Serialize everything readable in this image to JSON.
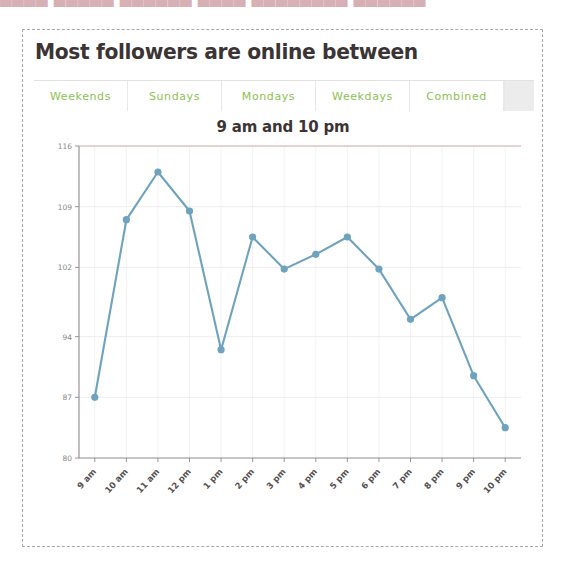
{
  "top_cut_text": "▄▄▄▄ ▄▄▄▄▄ ▄▄▄▄▄▄ ▄▄▄▄ ▄▄▄▄▄▄▄▄ ▄▄▄▄▄▄",
  "widget": {
    "title": "Most followers are online between"
  },
  "tabs": {
    "items": [
      {
        "label": "Weekends",
        "selected": false
      },
      {
        "label": "Sundays",
        "selected": false
      },
      {
        "label": "Mondays",
        "selected": false
      },
      {
        "label": "Weekdays",
        "selected": false
      },
      {
        "label": "Combined",
        "selected": false
      }
    ],
    "accent_color": "#8cc152"
  },
  "chart_data": {
    "type": "line",
    "title": "9 am and 10 pm",
    "xlabel": "",
    "ylabel": "",
    "categories": [
      "9 am",
      "10 am",
      "11 am",
      "12 pm",
      "1 pm",
      "2 pm",
      "3 pm",
      "4 pm",
      "5 pm",
      "6 pm",
      "7 pm",
      "8 pm",
      "9 pm",
      "10 pm"
    ],
    "values": [
      87,
      107.5,
      113,
      108.5,
      92.5,
      105.5,
      101.8,
      103.5,
      105.5,
      101.8,
      96,
      98.5,
      89.5,
      83.5
    ],
    "ytick_labels": [
      "116",
      "109",
      "102",
      "94",
      "87",
      "80"
    ],
    "ytick_values": [
      116,
      109,
      102,
      94,
      87,
      80
    ],
    "ylim": [
      80,
      116
    ],
    "grid": true,
    "legend": "none",
    "series_color": "#6fa3bd",
    "marker": "circle"
  }
}
